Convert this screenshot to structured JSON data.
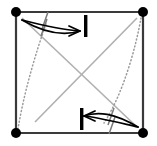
{
  "figure": {
    "title": "Square with diagonals, corner nodes and opposing curved shear arrows",
    "type": "line-diagram",
    "width": 157,
    "height": 146,
    "background_color": "#ffffff"
  },
  "colors": {
    "frame_stroke": "#3a3a3a",
    "diagonal_stroke": "#b0b0b0",
    "dotted_stroke": "#9a9a9a",
    "arrow_stroke": "#000000",
    "node_fill": "#000000",
    "bar_fill": "#000000",
    "tick_stroke": "#7a7a7a"
  },
  "geometry": {
    "square": {
      "left": 16,
      "top": 12,
      "right": 143,
      "bottom": 133,
      "stroke_width": 2.2
    },
    "nodes": [
      {
        "name": "node-top-left",
        "cx": 16,
        "cy": 12,
        "r": 5.0
      },
      {
        "name": "node-top-right",
        "cx": 143,
        "cy": 12,
        "r": 5.0
      },
      {
        "name": "node-bottom-left",
        "cx": 16,
        "cy": 133,
        "r": 5.0
      },
      {
        "name": "node-bottom-right",
        "cx": 143,
        "cy": 133,
        "r": 5.0
      }
    ],
    "diagonals": [
      {
        "name": "diagonal-tl-br",
        "x1": 22,
        "y1": 18,
        "x2": 137,
        "y2": 127
      },
      {
        "name": "diagonal-tr-bl",
        "x1": 137,
        "y1": 18,
        "x2": 35,
        "y2": 122
      }
    ],
    "dotted_curves": [
      {
        "name": "dotted-curve-left",
        "d": "M 46 24 C 36 52, 24 92, 18 129"
      },
      {
        "name": "dotted-curve-right",
        "d": "M 141 18 C 136 46, 124 92, 104 123"
      }
    ],
    "arrows": [
      {
        "name": "arrow-top-right",
        "direction": "right",
        "shaft_upper": "M 22 20 C 45 26, 66 30, 80 31",
        "shaft_lower": "M 22 20 C 46 34, 64 36, 80 31",
        "head": "M 80 31 L 69 26 M 80 31 L 69 36"
      },
      {
        "name": "arrow-bottom-left",
        "direction": "left",
        "shaft_upper": "M 138 127 C 116 122, 96 117, 84 116",
        "shaft_lower": "M 138 127 C 114 113, 98 111, 84 116",
        "head": "M 84 116 L 95 111 M 84 116 L 95 121"
      }
    ],
    "bars": [
      {
        "name": "bar-top",
        "x": 84,
        "y": 15,
        "width": 3.4,
        "height": 22
      },
      {
        "name": "bar-bottom",
        "x": 80,
        "y": 108,
        "width": 3.4,
        "height": 22
      }
    ],
    "ticks": [
      {
        "name": "tick-top-left-upper",
        "x1": 48,
        "y1": 12,
        "x2": 42,
        "y2": 29
      },
      {
        "name": "tick-top-left-lower",
        "x1": 47,
        "y1": 19,
        "x2": 41,
        "y2": 36
      },
      {
        "name": "tick-bottom-right-upper",
        "x1": 114,
        "y1": 108,
        "x2": 108,
        "y2": 125
      },
      {
        "name": "tick-bottom-right-lower",
        "x1": 115,
        "y1": 117,
        "x2": 109,
        "y2": 134
      }
    ]
  }
}
